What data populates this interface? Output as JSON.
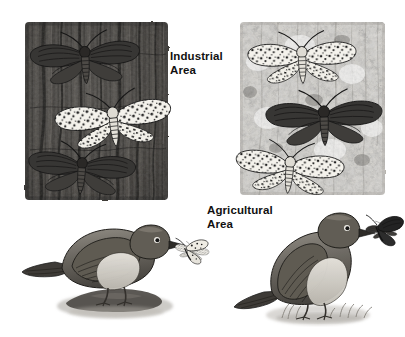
{
  "figure": {
    "medium": "grayscale pencil and ink illustration",
    "background_color": "#ffffff",
    "width": 405,
    "height": 337
  },
  "labels": {
    "industrial": "Industrial\nArea",
    "agricultural": "Agricultural\nArea",
    "text_color": "#111111"
  },
  "panels": [
    {
      "id": "industrial-bark-panel",
      "label": "Industrial\nArea",
      "description": "Dark soot-blackened tree bark",
      "bounds": {
        "x": 25,
        "y": 22,
        "width": 143,
        "height": 178
      },
      "bark_tone": "#4a4a4a",
      "moths": [
        {
          "id": "dark-moth-top",
          "morph": "melanic",
          "color": "#2e2e2e",
          "camouflaged": true
        },
        {
          "id": "light-moth-middle",
          "morph": "peppered",
          "color": "#f2f0ea",
          "camouflaged": false
        },
        {
          "id": "dark-moth-bottom",
          "morph": "melanic",
          "color": "#2e2e2e",
          "camouflaged": true
        }
      ]
    },
    {
      "id": "agricultural-bark-panel",
      "label": "Agricultural\nArea",
      "description": "Pale lichen-covered tree bark",
      "bounds": {
        "x": 240,
        "y": 22,
        "width": 145,
        "height": 173
      },
      "bark_tone": "#cfcdc8",
      "moths": [
        {
          "id": "light-moth-top",
          "morph": "peppered",
          "color": "#f4f2ec",
          "camouflaged": true
        },
        {
          "id": "dark-moth-middle",
          "morph": "melanic",
          "color": "#2b2b2b",
          "camouflaged": false
        },
        {
          "id": "light-moth-bottom",
          "morph": "peppered",
          "color": "#f4f2ec",
          "camouflaged": true
        }
      ]
    }
  ],
  "birds": [
    {
      "id": "bird-industrial",
      "side": "left",
      "facing": "right",
      "prey_morph": "peppered",
      "prey_color": "#efece4",
      "body_color": "#6e6a63",
      "bounds": {
        "x": 22,
        "y": 218,
        "width": 175,
        "height": 100
      },
      "description": "Bird perched on a rock holding a light peppered moth in its beak"
    },
    {
      "id": "bird-agricultural",
      "side": "right",
      "facing": "right",
      "prey_morph": "melanic",
      "prey_color": "#232323",
      "body_color": "#6e6a63",
      "bounds": {
        "x": 232,
        "y": 205,
        "width": 160,
        "height": 120
      },
      "description": "Bird standing on grass holding a dark melanic moth in its beak"
    }
  ],
  "palette": {
    "ink": "#1c1c1c",
    "dark_bark": "#3f3f3f",
    "light_bark": "#d4d2cd",
    "moth_light": "#f3f1eb",
    "moth_dark": "#2b2b2b",
    "bird_body": "#6e6a63",
    "paper": "#ffffff"
  }
}
